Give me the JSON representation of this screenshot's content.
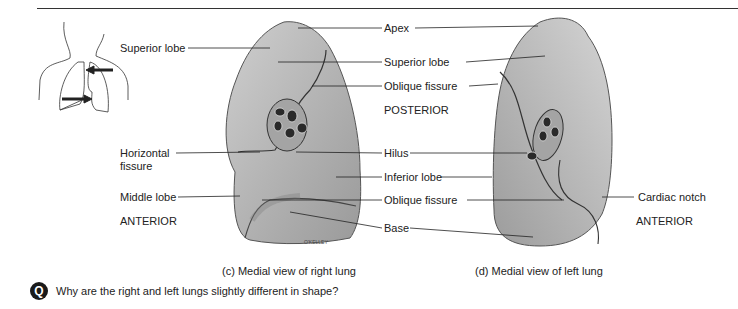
{
  "right_lung": {
    "labels": {
      "superior_lobe": "Superior lobe",
      "horizontal_fissure_line1": "Horizontal",
      "horizontal_fissure_line2": "fissure",
      "middle_lobe": "Middle lobe",
      "anterior": "ANTERIOR"
    },
    "signature": "O'KELLEY",
    "caption": "(c) Medial view of right lung"
  },
  "center_labels": {
    "apex": "Apex",
    "superior_lobe": "Superior lobe",
    "oblique_fissure_top": "Oblique fissure",
    "posterior": "POSTERIOR",
    "hilus": "Hilus",
    "inferior_lobe": "Inferior lobe",
    "oblique_fissure_bottom": "Oblique fissure",
    "base": "Base"
  },
  "left_lung": {
    "labels": {
      "cardiac_notch": "Cardiac notch",
      "anterior": "ANTERIOR"
    },
    "caption": "(d) Medial view of left lung"
  },
  "question": {
    "icon": "Q",
    "text": "Why are the right and left lungs slightly different in shape?"
  },
  "colors": {
    "lung_fill": "#b9b9b9",
    "lung_shadow": "#8a8a8a",
    "line": "#222222"
  }
}
